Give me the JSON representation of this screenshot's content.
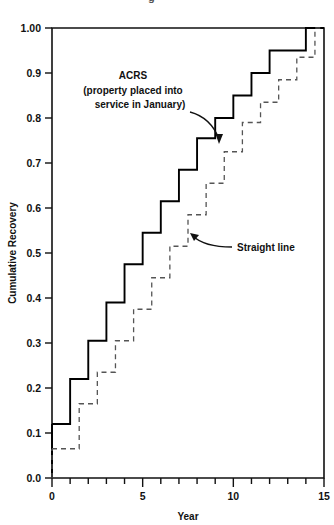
{
  "figure": {
    "cut_off_header": "g",
    "xlabel": "Year",
    "ylabel": "Cumulative Recovery"
  },
  "annotations": {
    "acrs": {
      "line1": "ACRS",
      "line2": "(property placed into",
      "line3": "service in January)"
    },
    "straight": "Straight line"
  },
  "ticks": {
    "y": [
      "0.0",
      "0.1",
      "0.2",
      "0.3",
      "0.4",
      "0.5",
      "0.6",
      "0.7",
      "0.8",
      "0.9",
      "1.00"
    ],
    "x": [
      "0",
      "5",
      "10",
      "15"
    ]
  },
  "chart_data": {
    "type": "line",
    "title": "",
    "xlabel": "Year",
    "ylabel": "Cumulative Recovery",
    "xlim": [
      0,
      15
    ],
    "ylim": [
      0.0,
      1.0
    ],
    "grid": false,
    "legend": "annotations-with-arrows",
    "x_major_ticks": [
      0,
      5,
      10,
      15
    ],
    "x_minor_ticks": [
      1,
      2,
      3,
      4,
      6,
      7,
      8,
      9,
      11,
      12,
      13,
      14
    ],
    "y_ticks": [
      0.0,
      0.1,
      0.2,
      0.3,
      0.4,
      0.5,
      0.6,
      0.7,
      0.8,
      0.9,
      1.0
    ],
    "step_style": "post",
    "series": [
      {
        "name": "ACRS (property placed into service in January)",
        "style": "solid",
        "color": "#000000",
        "x": [
          0,
          1,
          2,
          3,
          4,
          5,
          6,
          7,
          8,
          9,
          10,
          11,
          12,
          13,
          14,
          15
        ],
        "values": [
          0.12,
          0.22,
          0.305,
          0.39,
          0.475,
          0.545,
          0.615,
          0.685,
          0.755,
          0.8,
          0.85,
          0.9,
          0.95,
          0.95,
          1.0,
          1.0
        ]
      },
      {
        "name": "Straight line",
        "style": "dashed",
        "color": "#555555",
        "x": [
          0,
          0.5,
          1.5,
          2.5,
          3.5,
          4.5,
          5.5,
          6.5,
          7.5,
          8.5,
          9.5,
          10.5,
          11.5,
          12.5,
          13.5,
          14.5,
          15
        ],
        "values": [
          0.065,
          0.065,
          0.165,
          0.235,
          0.305,
          0.375,
          0.445,
          0.515,
          0.585,
          0.655,
          0.725,
          0.79,
          0.835,
          0.885,
          0.935,
          1.0,
          1.0
        ]
      }
    ]
  }
}
